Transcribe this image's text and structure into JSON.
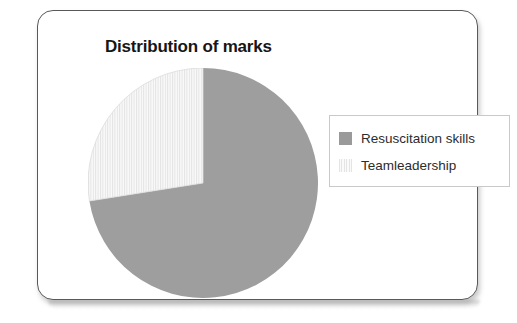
{
  "card": {
    "title": "Distribution of marks"
  },
  "legend": {
    "entries": [
      {
        "label": "Resuscitation skills",
        "swatch": "solid-gray-swatch",
        "color": "#9a9a9a"
      },
      {
        "label": "Teamleadership",
        "swatch": "light-striped-swatch",
        "color": "#f1f1f1"
      }
    ]
  },
  "chart_data": {
    "type": "pie",
    "title": "Distribution of marks",
    "xlabel": "",
    "ylabel": "",
    "categories": [
      "Resuscitation skills",
      "Teamleadership"
    ],
    "values": [
      72.5,
      27.5
    ],
    "value_unit": "percent",
    "colors": [
      "#9a9a9a",
      "#f1f1f1"
    ],
    "fill_styles": [
      "solid",
      "vertical-stripes"
    ],
    "start_angle_deg": 0,
    "direction": "counter-clockwise",
    "legend_position": "right",
    "grid": false,
    "data_labels_shown": false
  }
}
